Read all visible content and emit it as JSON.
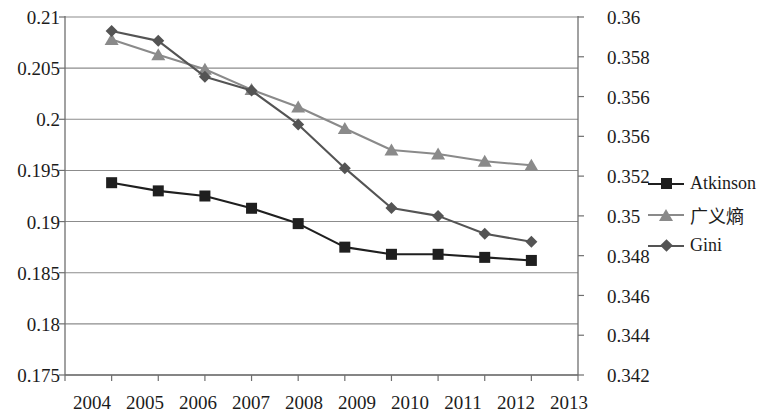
{
  "chart_data": {
    "type": "line",
    "title": "",
    "xlabel": "",
    "ylabel": "",
    "grid": true,
    "legend_position": "right",
    "categories": [
      "2004",
      "2005",
      "2006",
      "2007",
      "2008",
      "2009",
      "2010",
      "2011",
      "2012",
      "2013"
    ],
    "x": [
      2004,
      2005,
      2006,
      2007,
      2008,
      2009,
      2010,
      2011,
      2012,
      2013
    ],
    "axes": {
      "left": {
        "name": "primary",
        "ylim": [
          0.175,
          0.21
        ],
        "ticks": [
          "0.21",
          "0.205",
          "0.2",
          "0.195",
          "0.19",
          "0.185",
          "0.18",
          "0.175"
        ],
        "tick_values": [
          0.21,
          0.205,
          0.2,
          0.195,
          0.19,
          0.185,
          0.18,
          0.175
        ],
        "step": 0.005
      },
      "right": {
        "name": "secondary",
        "ylim": [
          0.342,
          0.36
        ],
        "ticks": [
          "0.36",
          "0.358",
          "0.356",
          "0.356",
          "0.352",
          "0.35",
          "0.348",
          "0.346",
          "0.344",
          "0.342"
        ],
        "tick_values": [
          0.36,
          0.358,
          0.356,
          0.354,
          0.352,
          0.35,
          0.348,
          0.346,
          0.344,
          0.342
        ],
        "step": 0.002
      }
    },
    "series": [
      {
        "name": "Atkinson",
        "axis": "left",
        "marker": "square",
        "color": "#1f1f1f",
        "values": [
          0.1938,
          0.193,
          0.1925,
          0.1913,
          0.1898,
          0.1875,
          0.1868,
          0.1868,
          0.1865,
          0.1862
        ]
      },
      {
        "name": "广义熵",
        "axis": "left",
        "marker": "triangle",
        "color": "#8a8a8a",
        "values": [
          0.2078,
          0.2063,
          0.2049,
          0.2029,
          0.2012,
          0.1991,
          0.197,
          0.1966,
          0.1959,
          0.1955
        ]
      },
      {
        "name": "Gini",
        "axis": "right",
        "marker": "diamond",
        "color": "#545454",
        "values": [
          0.3593,
          0.3588,
          0.357,
          0.3563,
          0.3546,
          0.3524,
          0.3504,
          0.35,
          0.3491,
          0.3487
        ]
      }
    ],
    "colors": {
      "atkinson": "#1f1f1f",
      "generalized_entropy": "#8a8a8a",
      "gini": "#545454",
      "gridline": "#8c8c8c",
      "axis": "#6f6f6f",
      "background": "#ffffff",
      "text": "#1c1c1c"
    }
  },
  "legend": {
    "items": [
      {
        "label": "Atkinson",
        "marker": "square-marker",
        "cjk": false
      },
      {
        "label": "广义熵",
        "marker": "triangle-marker",
        "cjk": true
      },
      {
        "label": "Gini",
        "marker": "diamond-marker",
        "cjk": false
      }
    ]
  }
}
